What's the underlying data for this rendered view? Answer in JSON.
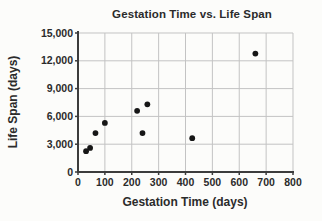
{
  "figure": {
    "background_color": "#fcfcfa"
  },
  "chart_data": {
    "type": "scatter",
    "title": "Gestation Time vs. Life Span",
    "xlabel": "Gestation Time (days)",
    "ylabel": "Life Span (days)",
    "xlim": [
      0,
      800
    ],
    "ylim": [
      0,
      15000
    ],
    "x_ticks": [
      0,
      100,
      200,
      300,
      400,
      500,
      600,
      700,
      800
    ],
    "x_tick_labels": [
      "0",
      "100",
      "200",
      "300",
      "400",
      "500",
      "600",
      "700",
      "800"
    ],
    "y_ticks": [
      0,
      3000,
      6000,
      9000,
      12000,
      15000
    ],
    "y_tick_labels": [
      "0",
      "3,000",
      "6,000",
      "9,000",
      "12,000",
      "15,000"
    ],
    "grid": true,
    "legend": "none",
    "points": [
      {
        "x": 30,
        "y": 2250
      },
      {
        "x": 45,
        "y": 2600
      },
      {
        "x": 65,
        "y": 4200
      },
      {
        "x": 100,
        "y": 5300
      },
      {
        "x": 220,
        "y": 6600
      },
      {
        "x": 240,
        "y": 4200
      },
      {
        "x": 258,
        "y": 7300
      },
      {
        "x": 425,
        "y": 3650
      },
      {
        "x": 660,
        "y": 12775
      }
    ],
    "colors": {
      "point": "#161616",
      "grid": "#c3c3c3",
      "axis": "#3c3c3c",
      "text": "#2b2b2b"
    }
  }
}
